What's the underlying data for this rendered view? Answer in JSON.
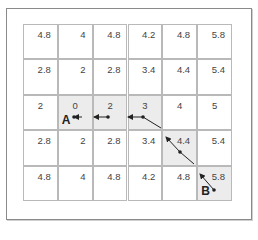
{
  "diagram": {
    "title": "",
    "grid": {
      "rows": 5,
      "cols": 6,
      "values": [
        [
          "4.8",
          "4",
          "4.8",
          "4.2",
          "4.8",
          "5.8"
        ],
        [
          "2.8",
          "2",
          "2.8",
          "3.4",
          "4.4",
          "5.4"
        ],
        [
          "2",
          "0",
          "2",
          "3",
          "4",
          "5"
        ],
        [
          "2.8",
          "2",
          "2.8",
          "3.4",
          "4.4",
          "5.4"
        ],
        [
          "4.8",
          "4",
          "4.8",
          "4.2",
          "4.8",
          "5.8"
        ]
      ],
      "path_cells": [
        [
          2,
          1
        ],
        [
          2,
          2
        ],
        [
          2,
          3
        ],
        [
          3,
          4
        ],
        [
          4,
          5
        ]
      ],
      "labels": {
        "start": {
          "text": "A",
          "row": 2,
          "col": 1
        },
        "goal": {
          "text": "B",
          "row": 4,
          "col": 5
        }
      }
    },
    "colors": {
      "cell_bg": "#ffffff",
      "path_bg": "#ececec",
      "grid_line": "#b9b9b9",
      "arrow": "#222222",
      "text": "#444444"
    }
  }
}
